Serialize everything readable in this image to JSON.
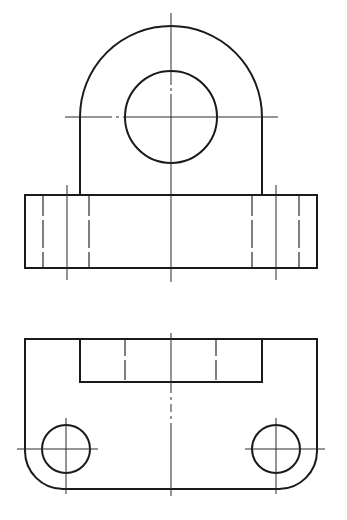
{
  "drawing": {
    "type": "orthographic-projection",
    "views": [
      "front-view",
      "side-view",
      "top-view"
    ],
    "colors": {
      "line": "#1a1a1a",
      "background": "#ffffff"
    },
    "front_view": {
      "center": [
        171,
        117
      ],
      "outer_arc_radius": 91,
      "bore_radius": 46,
      "upright_walls_x": [
        80,
        262
      ]
    },
    "side_view": {
      "rect": {
        "x": 25,
        "y": 195,
        "w": 292,
        "h": 73
      },
      "hole_hidden_lines_x": [
        43,
        89,
        252,
        299
      ],
      "hole_centerlines_x": [
        67,
        276
      ]
    },
    "top_view": {
      "outline": {
        "x": 25,
        "y": 339,
        "w": 292,
        "h": 150,
        "corner_radius": 38
      },
      "slot": {
        "x": 80,
        "y": 339,
        "w": 182,
        "h": 43
      },
      "slot_hidden_lines_x": [
        125,
        216
      ],
      "holes": [
        {
          "cx": 66,
          "cy": 449,
          "r": 24
        },
        {
          "cx": 276,
          "cy": 449,
          "r": 24
        }
      ]
    }
  }
}
